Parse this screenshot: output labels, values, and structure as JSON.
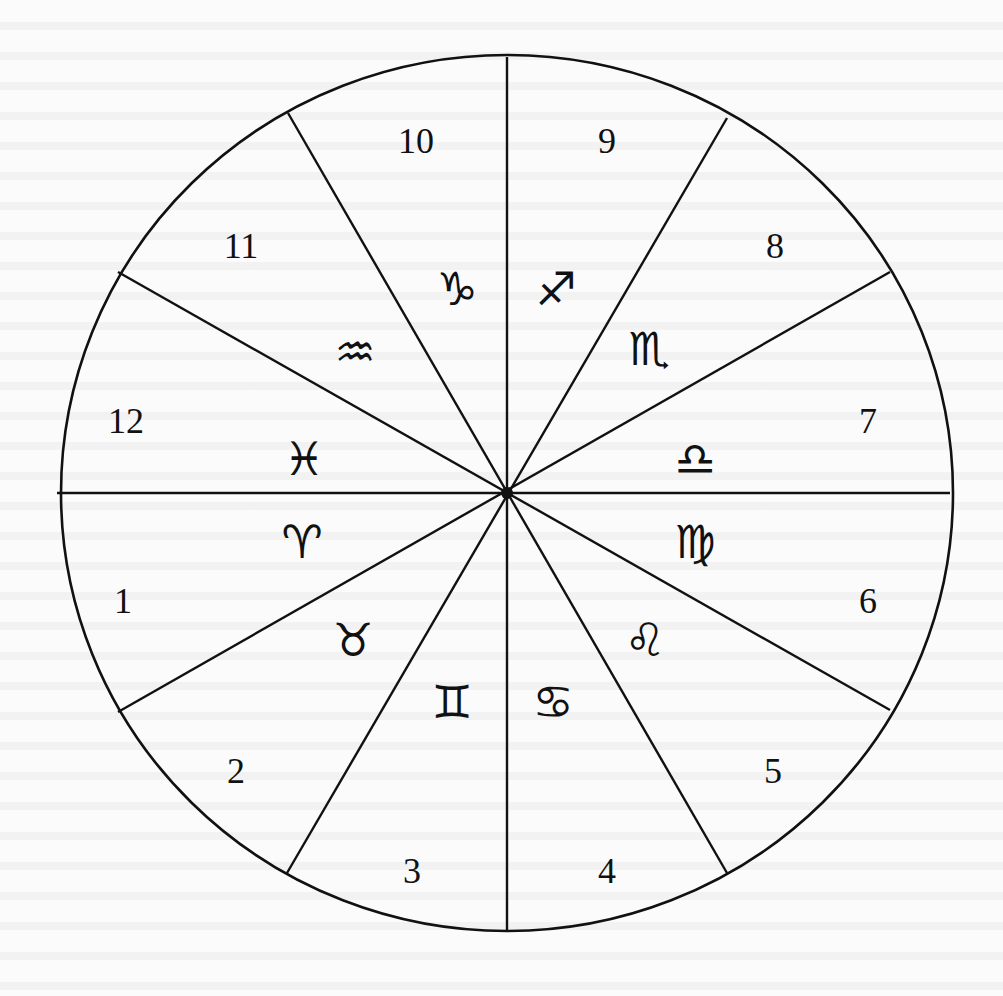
{
  "diagram": {
    "type": "astrological house chart",
    "center": [
      507,
      493
    ],
    "radius_x": 446,
    "radius_y": 438,
    "stroke_color": "#111111",
    "background_color": "#fbfbfb",
    "spokes": [
      {
        "from": [
          57,
          493
        ],
        "to": [
          950,
          493
        ]
      },
      {
        "from": [
          507,
          57
        ],
        "to": [
          507,
          932
        ]
      },
      {
        "from": [
          118,
          712
        ],
        "to": [
          890,
          272
        ]
      },
      {
        "from": [
          118,
          272
        ],
        "to": [
          890,
          710
        ]
      },
      {
        "from": [
          287,
          873
        ],
        "to": [
          727,
          118
        ]
      },
      {
        "from": [
          288,
          113
        ],
        "to": [
          727,
          873
        ]
      }
    ],
    "houses": [
      {
        "label": "1",
        "x": 123,
        "y": 605
      },
      {
        "label": "2",
        "x": 236,
        "y": 775
      },
      {
        "label": "3",
        "x": 412,
        "y": 875
      },
      {
        "label": "4",
        "x": 607,
        "y": 875
      },
      {
        "label": "5",
        "x": 773,
        "y": 775
      },
      {
        "label": "6",
        "x": 868,
        "y": 605
      },
      {
        "label": "7",
        "x": 868,
        "y": 425
      },
      {
        "label": "8",
        "x": 775,
        "y": 250
      },
      {
        "label": "9",
        "x": 607,
        "y": 145
      },
      {
        "label": "10",
        "x": 416,
        "y": 145
      },
      {
        "label": "11",
        "x": 241,
        "y": 250
      },
      {
        "label": "12",
        "x": 126,
        "y": 425
      }
    ],
    "signs": [
      {
        "name": "aries",
        "glyph": "♈",
        "x": 302,
        "y": 545
      },
      {
        "name": "taurus",
        "glyph": "♉",
        "x": 353,
        "y": 643
      },
      {
        "name": "gemini",
        "glyph": "♊",
        "x": 452,
        "y": 705
      },
      {
        "name": "cancer",
        "glyph": "♋",
        "x": 553,
        "y": 705
      },
      {
        "name": "leo",
        "glyph": "♌",
        "x": 645,
        "y": 643
      },
      {
        "name": "virgo",
        "glyph": "♍",
        "x": 695,
        "y": 545
      },
      {
        "name": "libra",
        "glyph": "♎",
        "x": 695,
        "y": 462
      },
      {
        "name": "scorpio",
        "glyph": "♏",
        "x": 649,
        "y": 352
      },
      {
        "name": "sagittarius",
        "glyph": "♐",
        "x": 556,
        "y": 292
      },
      {
        "name": "capricorn",
        "glyph": "♑",
        "x": 457,
        "y": 292
      },
      {
        "name": "aquarius",
        "glyph": "♒",
        "x": 355,
        "y": 355
      },
      {
        "name": "pisces",
        "glyph": "♓",
        "x": 304,
        "y": 462
      }
    ]
  }
}
